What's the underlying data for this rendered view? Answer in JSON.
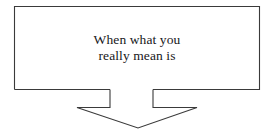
{
  "diagram": {
    "type": "flowchart-callout",
    "background_color": "#ffffff",
    "stroke_color": "#3a3a3a",
    "text_color": "#17171a",
    "box": {
      "name": "message-box",
      "x": 14,
      "y": 6,
      "width": 246,
      "height": 84,
      "fill": "#ffffff"
    },
    "arrow": {
      "name": "down-arrow",
      "direction": "down",
      "shaft_left_x": 110,
      "shaft_right_x": 153,
      "shoulder_y": 108,
      "wing_left_x": 77,
      "wing_right_x": 197,
      "tip_x": 138,
      "tip_y": 128,
      "fill": "#ffffff"
    },
    "caption": {
      "line1": "When what you",
      "line2": "really mean is",
      "full_text": "When what you really mean is",
      "align": "center"
    }
  }
}
